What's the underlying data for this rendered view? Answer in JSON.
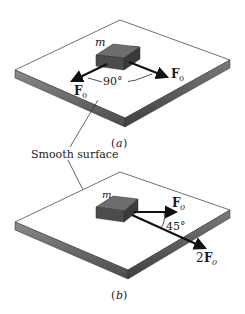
{
  "figure": {
    "panels": [
      {
        "id": "a",
        "caption": "(a)",
        "caption_letter": "a",
        "mass_label": "m",
        "forces": [
          {
            "label": "F",
            "subscript": "0",
            "coefficient": "",
            "direction": "front-left"
          },
          {
            "label": "F",
            "subscript": "0",
            "coefficient": "",
            "direction": "front-right"
          }
        ],
        "angle_label": "90°",
        "angle_degrees": 90
      },
      {
        "id": "b",
        "caption": "(b)",
        "caption_letter": "b",
        "mass_label": "m",
        "forces": [
          {
            "label": "F",
            "subscript": "0",
            "coefficient": "",
            "direction": "right"
          },
          {
            "label": "F",
            "subscript": "0",
            "coefficient": "2",
            "direction": "down-right"
          }
        ],
        "angle_label": "45°",
        "angle_degrees": 45
      }
    ],
    "shared_label": "Smooth surface",
    "colors": {
      "surface_top": "#ffffff",
      "surface_edge": "#6e6e6e",
      "block": "#5a5a5a",
      "arrow": "#111111"
    }
  }
}
